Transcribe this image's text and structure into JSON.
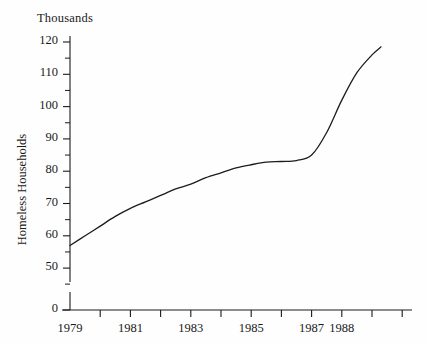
{
  "chart_data": {
    "type": "line",
    "title": "",
    "unit_caption": "Thousands",
    "xlabel": "",
    "ylabel": "Homeless Households",
    "ylim": [
      50,
      120
    ],
    "y_axis_break": true,
    "y_zero_label": "0",
    "ytick_labels": [
      "120",
      "110",
      "100",
      "90",
      "80",
      "70",
      "60",
      "50",
      "0"
    ],
    "ytick_values": [
      120,
      110,
      100,
      90,
      80,
      70,
      60,
      50,
      0
    ],
    "y_minor_ticks": [
      115,
      105,
      95,
      85,
      75,
      65,
      55
    ],
    "xtick_labels": [
      "1979",
      "1981",
      "1983",
      "1985",
      "1987",
      "1988"
    ],
    "xtick_values": [
      1979,
      1981,
      1983,
      1985,
      1987,
      1988
    ],
    "x_all_ticks": [
      1979,
      1980,
      1981,
      1982,
      1983,
      1984,
      1985,
      1986,
      1987,
      1988,
      1989,
      1990
    ],
    "grid": false,
    "legend": false,
    "line_color": "#1c1c1c",
    "line_width": 1.3,
    "axis_color": "#1a1a1a",
    "series": [
      {
        "name": "Homeless Households",
        "x": [
          1979.0,
          1979.5,
          1980.0,
          1980.5,
          1981.0,
          1981.5,
          1982.0,
          1982.5,
          1983.0,
          1983.5,
          1984.0,
          1984.5,
          1985.0,
          1985.5,
          1986.0,
          1986.5,
          1987.0,
          1987.5,
          1988.0,
          1988.5,
          1989.0,
          1989.3
        ],
        "values": [
          57.0,
          60.0,
          63.0,
          66.0,
          68.5,
          70.5,
          72.5,
          74.5,
          76.0,
          78.0,
          79.5,
          81.0,
          82.0,
          82.8,
          83.0,
          83.3,
          85.0,
          92.0,
          102.0,
          110.5,
          116.0,
          118.5
        ]
      }
    ]
  },
  "axes": {
    "y_pixel_map": {
      "120": 42,
      "110": 74.3,
      "100": 106.6,
      "90": 138.9,
      "80": 171.2,
      "70": 203.5,
      "60": 235.8,
      "50": 268.1,
      "0": 310
    },
    "x_pixel_map": {
      "1979": 70,
      "1981": 130.4,
      "1983": 190.8,
      "1985": 251.2,
      "1987": 311.6,
      "1988": 341.8,
      "1990": 402.2
    },
    "plot_left": 70,
    "plot_right": 412,
    "plot_top": 36,
    "plot_bottom": 310
  }
}
